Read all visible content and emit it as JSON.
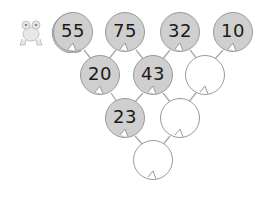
{
  "puzzle": {
    "type": "number pyramid",
    "colors": {
      "filled_pad": "#cfcfcf",
      "empty_pad": "#ffffff",
      "outline": "#9a9a9a",
      "stem": "#a0a0a0"
    },
    "rows": [
      [
        "55",
        "75",
        "32",
        "10"
      ],
      [
        "20",
        "43",
        ""
      ],
      [
        "23",
        ""
      ],
      [
        ""
      ]
    ]
  },
  "decoration": {
    "icon": "frog-icon"
  }
}
